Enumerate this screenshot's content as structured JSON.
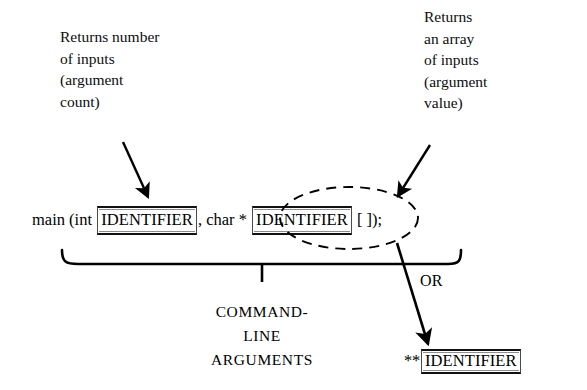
{
  "figure": {
    "kind": "syntax-annotation-diagram",
    "background_color": "#ffffff",
    "ink_color": "#000000"
  },
  "annotations": {
    "left_note": {
      "lines": [
        "Returns number",
        "of inputs",
        "(argument",
        "count)"
      ],
      "text": "Returns number\nof inputs\n(argument\ncount)",
      "points_to": "argc-identifier-box"
    },
    "right_note": {
      "lines": [
        "Returns",
        "an array",
        "of inputs",
        "(argument",
        "value)"
      ],
      "text": "Returns\nan array\nof inputs\n(argument\nvalue)",
      "points_to": "argv-dashed-ellipse"
    }
  },
  "code_line": {
    "full_text": "main (int IDENTIFIER, char * IDENTIFIER [ ]);",
    "tokens": {
      "prefix": "main (int ",
      "identifier_1": "IDENTIFIER",
      "middle": ", char ",
      "star": "* ",
      "identifier_2": "IDENTIFIER",
      "suffix": " [ ]);"
    }
  },
  "brace": {
    "caption_lines": [
      "COMMAND-",
      "LINE",
      "ARGUMENTS"
    ],
    "caption_text": "COMMAND-LINE ARGUMENTS"
  },
  "alternative": {
    "or_label": "OR",
    "stars": "**",
    "identifier": "IDENTIFIER",
    "full_text": "**IDENTIFIER"
  }
}
